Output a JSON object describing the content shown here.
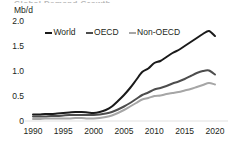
{
  "title_fragment": "Global Demand Growth",
  "axis": {
    "y_unit": "Mb/d",
    "y_ticks": [
      "2.0",
      "1.5",
      "1.0",
      "0.5",
      "0"
    ],
    "x_ticks": [
      "1990",
      "1995",
      "2000",
      "2005",
      "2010",
      "2015",
      "2020"
    ]
  },
  "legend": {
    "items": [
      {
        "label": "World",
        "color": "#1a1a1a"
      },
      {
        "label": "OECD",
        "color": "#4d4d4d"
      },
      {
        "label": "Non-OECD",
        "color": "#a6a6a6"
      }
    ]
  },
  "chart_data": {
    "type": "line",
    "title": "Global Demand Growth",
    "xlabel": "",
    "ylabel": "Mb/d",
    "ylim": [
      0,
      2.0
    ],
    "xlim": [
      1990,
      2020
    ],
    "grid": false,
    "legend_position": "top-center",
    "x": [
      1990,
      1991,
      1992,
      1993,
      1994,
      1995,
      1996,
      1997,
      1998,
      1999,
      2000,
      2001,
      2002,
      2003,
      2004,
      2005,
      2006,
      2007,
      2008,
      2009,
      2010,
      2011,
      2012,
      2013,
      2014,
      2015,
      2016,
      2017,
      2018,
      2019,
      2020
    ],
    "series": [
      {
        "name": "World",
        "color": "#1a1a1a",
        "values": [
          0.13,
          0.13,
          0.14,
          0.14,
          0.15,
          0.16,
          0.17,
          0.18,
          0.18,
          0.17,
          0.16,
          0.18,
          0.22,
          0.29,
          0.4,
          0.52,
          0.66,
          0.82,
          0.98,
          1.05,
          1.16,
          1.2,
          1.28,
          1.36,
          1.42,
          1.5,
          1.58,
          1.66,
          1.74,
          1.8,
          1.7
        ]
      },
      {
        "name": "OECD",
        "color": "#4d4d4d",
        "values": [
          0.09,
          0.09,
          0.09,
          0.1,
          0.1,
          0.11,
          0.12,
          0.12,
          0.12,
          0.12,
          0.12,
          0.13,
          0.15,
          0.18,
          0.23,
          0.29,
          0.36,
          0.44,
          0.52,
          0.57,
          0.63,
          0.66,
          0.7,
          0.75,
          0.79,
          0.84,
          0.9,
          0.96,
          1.0,
          1.01,
          0.93
        ]
      },
      {
        "name": "Non-OECD",
        "color": "#a6a6a6",
        "values": [
          0.04,
          0.04,
          0.05,
          0.05,
          0.05,
          0.05,
          0.05,
          0.06,
          0.06,
          0.05,
          0.05,
          0.06,
          0.08,
          0.11,
          0.16,
          0.22,
          0.29,
          0.36,
          0.43,
          0.46,
          0.5,
          0.51,
          0.54,
          0.56,
          0.58,
          0.61,
          0.64,
          0.68,
          0.72,
          0.76,
          0.73
        ]
      }
    ]
  }
}
